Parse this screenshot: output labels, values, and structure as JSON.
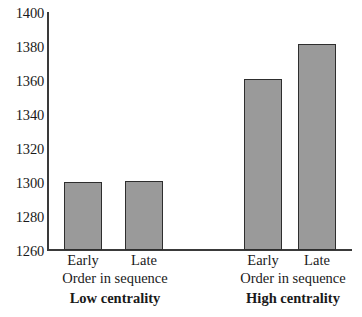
{
  "chart_data": {
    "type": "bar",
    "title": "",
    "xlabel": "Order in sequence",
    "ylabel": "",
    "ylim": [
      1260,
      1400
    ],
    "ytick_labels": [
      "1400",
      "1380",
      "1360",
      "1340",
      "1320",
      "1300",
      "1280",
      "1260"
    ],
    "ytick_values": [
      1400,
      1380,
      1360,
      1340,
      1320,
      1300,
      1280,
      1260
    ],
    "grid": false,
    "legend": false,
    "groups": [
      {
        "title": "Low centrality",
        "axis_label": "Order in sequence",
        "categories": [
          "Early",
          "Late"
        ],
        "values": [
          1300,
          1301
        ]
      },
      {
        "title": "High centrality",
        "axis_label": "Order in sequence",
        "categories": [
          "Early",
          "Late"
        ],
        "values": [
          1361,
          1382
        ]
      }
    ],
    "categories": [
      "Early",
      "Late",
      "Early",
      "Late"
    ],
    "values": [
      1300,
      1301,
      1361,
      1382
    ],
    "bar_color": "#9a9a9a",
    "bar_edge_color": "#2e2e2e",
    "axis_color": "#3a3a3a"
  }
}
